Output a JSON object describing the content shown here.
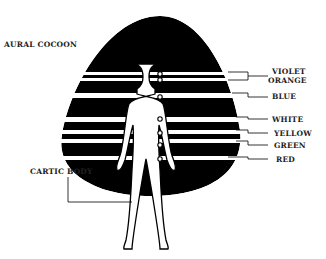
{
  "title": "FIGURE 1x",
  "labels": {
    "aural_cocoon": "AURAL COCOON",
    "cartic_body": "CARTIC BODY"
  },
  "bands": [
    {
      "name": "VIOLET",
      "y": 72
    },
    {
      "name": "ORANGE",
      "y": 80
    },
    {
      "name": "BLUE",
      "y": 97
    },
    {
      "name": "WHITE",
      "y": 119
    },
    {
      "name": "YELLOW",
      "y": 133
    },
    {
      "name": "GREEN",
      "y": 145
    },
    {
      "name": "RED",
      "y": 159
    }
  ],
  "colors": {
    "ink": "#000000",
    "paper": "#ffffff"
  }
}
